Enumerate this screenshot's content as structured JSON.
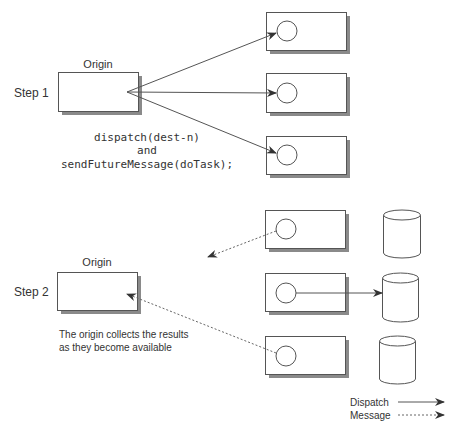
{
  "step1": {
    "label": "Step 1",
    "origin_label": "Origin",
    "code_lines": [
      "dispatch(dest-n)",
      "and",
      "sendFutureMessage(doTask);"
    ]
  },
  "step2": {
    "label": "Step 2",
    "origin_label": "Origin",
    "caption_lines": [
      "The origin collects the results",
      "as they become available"
    ]
  },
  "legend": {
    "items": [
      {
        "label": "Dispatch",
        "style": "solid"
      },
      {
        "label": "Message",
        "style": "dashed"
      }
    ]
  },
  "colors": {
    "stroke": "#555555",
    "shadow": "#8a8a8a",
    "text": "#333333"
  }
}
